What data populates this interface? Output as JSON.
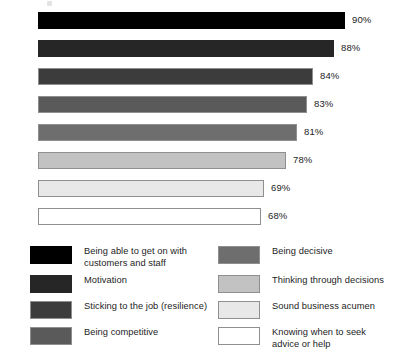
{
  "chart_data": {
    "type": "bar",
    "orientation": "horizontal",
    "title": "",
    "subtitle": "",
    "xlabel": "",
    "ylabel": "",
    "grid": false,
    "axis_visible": false,
    "legend_position": "bottom",
    "legend_columns": 2,
    "value_label_suffix": "%",
    "xlim": [
      0,
      100
    ],
    "categories": [
      "Being able to get on with customers and staff",
      "Motivation",
      "Sticking to the job (resilience)",
      "Being competitive",
      "Being decisive",
      "Thinking through decisions",
      "Sound business acumen",
      "Knowing when to seek advice or help"
    ],
    "values": [
      90,
      88,
      84,
      83,
      81,
      78,
      69,
      68
    ],
    "value_labels": [
      "90%",
      "88%",
      "84%",
      "83%",
      "81%",
      "78%",
      "69%",
      "68%"
    ],
    "colors": [
      "#000000",
      "#262626",
      "#3c3c3c",
      "#5a5a5a",
      "#6e6e6e",
      "#c2c2c2",
      "#e8e8e8",
      "#ffffff"
    ]
  },
  "bars": [
    {
      "value_label": "90%",
      "width_px": 307,
      "color": "#000000",
      "bordered": false
    },
    {
      "value_label": "88%",
      "width_px": 296,
      "color": "#262626",
      "bordered": false
    },
    {
      "value_label": "84%",
      "width_px": 275,
      "color": "#3c3c3c",
      "bordered": true
    },
    {
      "value_label": "83%",
      "width_px": 269,
      "color": "#5a5a5a",
      "bordered": true
    },
    {
      "value_label": "81%",
      "width_px": 259,
      "color": "#6e6e6e",
      "bordered": true
    },
    {
      "value_label": "78%",
      "width_px": 248,
      "color": "#c2c2c2",
      "bordered": true
    },
    {
      "value_label": "69%",
      "width_px": 226,
      "color": "#e8e8e8",
      "bordered": true
    },
    {
      "value_label": "68%",
      "width_px": 223,
      "color": "#ffffff",
      "bordered": true
    }
  ],
  "legend": {
    "left_column": [
      {
        "label": "Being able to get on with\ncustomers and staff",
        "color": "#000000",
        "bordered": false
      },
      {
        "label": "Motivation",
        "color": "#262626",
        "bordered": false
      },
      {
        "label": "Sticking to the job (resilience)",
        "color": "#3c3c3c",
        "bordered": true
      },
      {
        "label": "Being competitive",
        "color": "#5a5a5a",
        "bordered": true
      }
    ],
    "right_column": [
      {
        "label": "Being decisive",
        "color": "#6e6e6e",
        "bordered": true
      },
      {
        "label": "Thinking through decisions",
        "color": "#c2c2c2",
        "bordered": true
      },
      {
        "label": "Sound business acumen",
        "color": "#e8e8e8",
        "bordered": true
      },
      {
        "label": "Knowing when to seek\nadvice or help",
        "color": "#ffffff",
        "bordered": true
      }
    ]
  }
}
